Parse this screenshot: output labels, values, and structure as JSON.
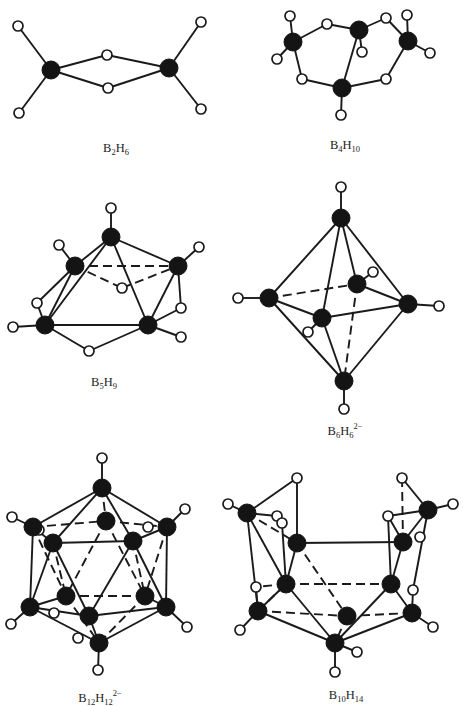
{
  "figure": {
    "colors": {
      "boron": "#141414",
      "hydrogen_fill": "#ffffff",
      "bond": "#1a1a1a",
      "background": "#ffffff"
    },
    "molecules": [
      {
        "id": "b2h6",
        "label": {
          "B": "B",
          "b_count": "2",
          "H": "H",
          "h_count": "6",
          "charge": ""
        },
        "label_pos": [
          116,
          150
        ],
        "atoms": [
          {
            "t": "B",
            "x": 51,
            "y": 70
          },
          {
            "t": "B",
            "x": 169,
            "y": 68
          },
          {
            "t": "H",
            "x": 18,
            "y": 26
          },
          {
            "t": "H",
            "x": 19,
            "y": 113
          },
          {
            "t": "H",
            "x": 107,
            "y": 55
          },
          {
            "t": "H",
            "x": 108,
            "y": 88
          },
          {
            "t": "H",
            "x": 201,
            "y": 22
          },
          {
            "t": "H",
            "x": 201,
            "y": 109
          }
        ],
        "bonds": [
          [
            0,
            2
          ],
          [
            0,
            3
          ],
          [
            0,
            4
          ],
          [
            0,
            5
          ],
          [
            1,
            4
          ],
          [
            1,
            5
          ],
          [
            1,
            6
          ],
          [
            1,
            7
          ]
        ],
        "dashed": []
      },
      {
        "id": "b4h10",
        "label": {
          "B": "B",
          "b_count": "4",
          "H": "H",
          "h_count": "10",
          "charge": ""
        },
        "label_pos": [
          345,
          147
        ],
        "atoms": [
          {
            "t": "B",
            "x": 293,
            "y": 42
          },
          {
            "t": "B",
            "x": 359,
            "y": 30
          },
          {
            "t": "B",
            "x": 408,
            "y": 41
          },
          {
            "t": "B",
            "x": 342,
            "y": 88
          },
          {
            "t": "H",
            "x": 290,
            "y": 16
          },
          {
            "t": "H",
            "x": 277,
            "y": 59
          },
          {
            "t": "H",
            "x": 327,
            "y": 24
          },
          {
            "t": "H",
            "x": 362,
            "y": 52
          },
          {
            "t": "H",
            "x": 386,
            "y": 18
          },
          {
            "t": "H",
            "x": 407,
            "y": 15
          },
          {
            "t": "H",
            "x": 430,
            "y": 53
          },
          {
            "t": "H",
            "x": 302,
            "y": 79
          },
          {
            "t": "H",
            "x": 386,
            "y": 79
          },
          {
            "t": "H",
            "x": 341,
            "y": 115
          }
        ],
        "bonds": [
          [
            0,
            4
          ],
          [
            0,
            5
          ],
          [
            0,
            6
          ],
          [
            6,
            1
          ],
          [
            1,
            7
          ],
          [
            1,
            8
          ],
          [
            8,
            2
          ],
          [
            2,
            9
          ],
          [
            2,
            10
          ],
          [
            0,
            11
          ],
          [
            11,
            3
          ],
          [
            2,
            12
          ],
          [
            12,
            3
          ],
          [
            1,
            3
          ],
          [
            3,
            13
          ]
        ],
        "dashed": []
      },
      {
        "id": "b5h9",
        "label": {
          "B": "B",
          "b_count": "5",
          "H": "H",
          "h_count": "9",
          "charge": ""
        },
        "label_pos": [
          104,
          384
        ],
        "atoms": [
          {
            "t": "B",
            "x": 111,
            "y": 237
          },
          {
            "t": "B",
            "x": 75,
            "y": 266
          },
          {
            "t": "B",
            "x": 178,
            "y": 266
          },
          {
            "t": "B",
            "x": 45,
            "y": 325
          },
          {
            "t": "B",
            "x": 148,
            "y": 325
          },
          {
            "t": "H",
            "x": 111,
            "y": 208
          },
          {
            "t": "H",
            "x": 59,
            "y": 245
          },
          {
            "t": "H",
            "x": 199,
            "y": 247
          },
          {
            "t": "H",
            "x": 122,
            "y": 288
          },
          {
            "t": "H",
            "x": 37,
            "y": 303
          },
          {
            "t": "H",
            "x": 181,
            "y": 308
          },
          {
            "t": "H",
            "x": 13,
            "y": 327
          },
          {
            "t": "H",
            "x": 181,
            "y": 337
          },
          {
            "t": "H",
            "x": 89,
            "y": 351
          }
        ],
        "bonds": [
          [
            0,
            5
          ],
          [
            0,
            1
          ],
          [
            0,
            2
          ],
          [
            0,
            3
          ],
          [
            0,
            4
          ],
          [
            1,
            3
          ],
          [
            1,
            6
          ],
          [
            2,
            7
          ],
          [
            2,
            4
          ],
          [
            3,
            4
          ],
          [
            3,
            9
          ],
          [
            9,
            1
          ],
          [
            3,
            11
          ],
          [
            3,
            13
          ],
          [
            13,
            4
          ],
          [
            4,
            10
          ],
          [
            10,
            2
          ],
          [
            4,
            12
          ]
        ],
        "dashed": [
          [
            1,
            2
          ],
          [
            1,
            8
          ],
          [
            8,
            2
          ]
        ]
      },
      {
        "id": "b6h6",
        "label": {
          "B": "B",
          "b_count": "6",
          "H": "H",
          "h_count": "6",
          "charge": "2−"
        },
        "label_pos": [
          345,
          430
        ],
        "atoms": [
          {
            "t": "B",
            "x": 341,
            "y": 218
          },
          {
            "t": "B",
            "x": 269,
            "y": 298
          },
          {
            "t": "B",
            "x": 357,
            "y": 284
          },
          {
            "t": "B",
            "x": 408,
            "y": 304
          },
          {
            "t": "B",
            "x": 322,
            "y": 318
          },
          {
            "t": "B",
            "x": 344,
            "y": 381
          },
          {
            "t": "H",
            "x": 341,
            "y": 187
          },
          {
            "t": "H",
            "x": 238,
            "y": 298
          },
          {
            "t": "H",
            "x": 373,
            "y": 272
          },
          {
            "t": "H",
            "x": 439,
            "y": 306
          },
          {
            "t": "H",
            "x": 308,
            "y": 332
          },
          {
            "t": "H",
            "x": 344,
            "y": 409
          }
        ],
        "bonds": [
          [
            0,
            6
          ],
          [
            0,
            1
          ],
          [
            0,
            2
          ],
          [
            0,
            3
          ],
          [
            0,
            4
          ],
          [
            1,
            4
          ],
          [
            1,
            5
          ],
          [
            1,
            7
          ],
          [
            2,
            3
          ],
          [
            2,
            8
          ],
          [
            3,
            4
          ],
          [
            3,
            5
          ],
          [
            3,
            9
          ],
          [
            4,
            5
          ],
          [
            4,
            10
          ],
          [
            5,
            11
          ]
        ],
        "dashed": [
          [
            1,
            2
          ],
          [
            2,
            5
          ]
        ]
      },
      {
        "id": "b12h12",
        "label": {
          "B": "B",
          "b_count": "12",
          "H": "H",
          "h_count": "12",
          "charge": "2−"
        },
        "label_pos": [
          100,
          697
        ],
        "atoms": [
          {
            "t": "B",
            "x": 102,
            "y": 488
          },
          {
            "t": "B",
            "x": 33,
            "y": 527
          },
          {
            "t": "B",
            "x": 106,
            "y": 521
          },
          {
            "t": "B",
            "x": 167,
            "y": 527
          },
          {
            "t": "B",
            "x": 53,
            "y": 543
          },
          {
            "t": "B",
            "x": 133,
            "y": 541
          },
          {
            "t": "B",
            "x": 66,
            "y": 596
          },
          {
            "t": "B",
            "x": 145,
            "y": 596
          },
          {
            "t": "B",
            "x": 30,
            "y": 607
          },
          {
            "t": "B",
            "x": 89,
            "y": 616
          },
          {
            "t": "B",
            "x": 166,
            "y": 607
          },
          {
            "t": "B",
            "x": 99,
            "y": 643
          },
          {
            "t": "H",
            "x": 102,
            "y": 458
          },
          {
            "t": "H",
            "x": 12,
            "y": 517
          },
          {
            "t": "H",
            "x": 39,
            "y": 530
          },
          {
            "t": "H",
            "x": 148,
            "y": 527
          },
          {
            "t": "H",
            "x": 185,
            "y": 509
          },
          {
            "t": "H",
            "x": 11,
            "y": 624
          },
          {
            "t": "H",
            "x": 54,
            "y": 613
          },
          {
            "t": "H",
            "x": 78,
            "y": 638
          },
          {
            "t": "H",
            "x": 187,
            "y": 627
          },
          {
            "t": "H",
            "x": 98,
            "y": 670
          }
        ],
        "bonds": [
          [
            0,
            12
          ],
          [
            0,
            1
          ],
          [
            0,
            3
          ],
          [
            0,
            4
          ],
          [
            0,
            5
          ],
          [
            1,
            4
          ],
          [
            1,
            8
          ],
          [
            1,
            13
          ],
          [
            3,
            5
          ],
          [
            3,
            10
          ],
          [
            3,
            16
          ],
          [
            4,
            5
          ],
          [
            4,
            8
          ],
          [
            4,
            9
          ],
          [
            5,
            9
          ],
          [
            5,
            10
          ],
          [
            8,
            9
          ],
          [
            9,
            10
          ],
          [
            8,
            11
          ],
          [
            9,
            11
          ],
          [
            10,
            11
          ],
          [
            11,
            21
          ],
          [
            8,
            17
          ],
          [
            10,
            20
          ],
          [
            6,
            8
          ],
          [
            7,
            10
          ]
        ],
        "dashed": [
          [
            0,
            2
          ],
          [
            1,
            2
          ],
          [
            2,
            3
          ],
          [
            6,
            7
          ],
          [
            6,
            11
          ],
          [
            7,
            11
          ],
          [
            4,
            6
          ],
          [
            5,
            7
          ],
          [
            2,
            6
          ],
          [
            2,
            7
          ],
          [
            1,
            6
          ],
          [
            3,
            7
          ]
        ]
      },
      {
        "id": "b10h14",
        "label": {
          "B": "B",
          "b_count": "10",
          "H": "H",
          "h_count": "14",
          "charge": ""
        },
        "label_pos": [
          346,
          697
        ],
        "atoms": [
          {
            "t": "B",
            "x": 247,
            "y": 513
          },
          {
            "t": "B",
            "x": 297,
            "y": 543
          },
          {
            "t": "B",
            "x": 403,
            "y": 542
          },
          {
            "t": "B",
            "x": 428,
            "y": 510
          },
          {
            "t": "B",
            "x": 286,
            "y": 584
          },
          {
            "t": "B",
            "x": 391,
            "y": 584
          },
          {
            "t": "B",
            "x": 258,
            "y": 611
          },
          {
            "t": "B",
            "x": 347,
            "y": 616
          },
          {
            "t": "B",
            "x": 412,
            "y": 613
          },
          {
            "t": "B",
            "x": 335,
            "y": 643
          },
          {
            "t": "H",
            "x": 228,
            "y": 504
          },
          {
            "t": "H",
            "x": 297,
            "y": 478
          },
          {
            "t": "H",
            "x": 277,
            "y": 516
          },
          {
            "t": "H",
            "x": 282,
            "y": 523
          },
          {
            "t": "H",
            "x": 402,
            "y": 478
          },
          {
            "t": "H",
            "x": 388,
            "y": 516
          },
          {
            "t": "H",
            "x": 453,
            "y": 504
          },
          {
            "t": "H",
            "x": 420,
            "y": 537
          },
          {
            "t": "H",
            "x": 256,
            "y": 587
          },
          {
            "t": "H",
            "x": 413,
            "y": 590
          },
          {
            "t": "H",
            "x": 240,
            "y": 630
          },
          {
            "t": "H",
            "x": 433,
            "y": 627
          },
          {
            "t": "H",
            "x": 357,
            "y": 652
          },
          {
            "t": "H",
            "x": 335,
            "y": 672
          }
        ],
        "bonds": [
          [
            0,
            10
          ],
          [
            0,
            11
          ],
          [
            11,
            1
          ],
          [
            0,
            12
          ],
          [
            12,
            13
          ],
          [
            13,
            4
          ],
          [
            0,
            6
          ],
          [
            0,
            4
          ],
          [
            1,
            2
          ],
          [
            1,
            4
          ],
          [
            2,
            15
          ],
          [
            15,
            5
          ],
          [
            2,
            5
          ],
          [
            3,
            14
          ],
          [
            3,
            16
          ],
          [
            3,
            15
          ],
          [
            3,
            2
          ],
          [
            4,
            6
          ],
          [
            4,
            9
          ],
          [
            5,
            8
          ],
          [
            5,
            9
          ],
          [
            6,
            9
          ],
          [
            8,
            9
          ],
          [
            6,
            20
          ],
          [
            8,
            21
          ],
          [
            9,
            22
          ],
          [
            9,
            23
          ],
          [
            6,
            18
          ],
          [
            8,
            19
          ],
          [
            3,
            19
          ]
        ],
        "dashed": [
          [
            1,
            7
          ],
          [
            4,
            5
          ],
          [
            6,
            7
          ],
          [
            7,
            8
          ],
          [
            7,
            9
          ],
          [
            0,
            1
          ],
          [
            14,
            2
          ],
          [
            2,
            17
          ],
          [
            4,
            18
          ],
          [
            6,
            4
          ]
        ]
      }
    ]
  }
}
